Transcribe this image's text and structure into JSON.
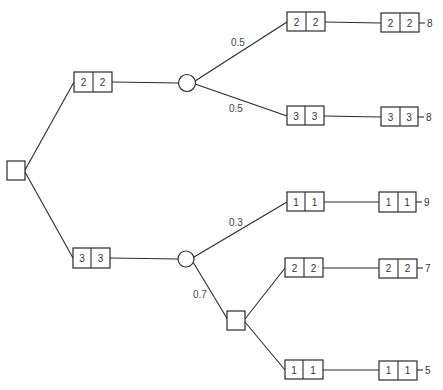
{
  "diagram": {
    "type": "decision-tree",
    "root": {
      "kind": "decision-node",
      "shape": "square"
    },
    "branches": [
      {
        "state": [
          "2",
          "2"
        ],
        "chance_node": "circle",
        "outcomes": [
          {
            "probability": "0.5",
            "state": [
              "2",
              "2"
            ],
            "final_state": [
              "2",
              "2"
            ],
            "payoff": "8"
          },
          {
            "probability": "0.5",
            "state": [
              "3",
              "3"
            ],
            "final_state": [
              "3",
              "3"
            ],
            "payoff": "8"
          }
        ]
      },
      {
        "state": [
          "3",
          "3"
        ],
        "chance_node": "circle",
        "outcomes": [
          {
            "probability": "0.3",
            "state": [
              "1",
              "1"
            ],
            "final_state": [
              "1",
              "1"
            ],
            "payoff": "9"
          },
          {
            "probability": "0.7",
            "decision_node": "square",
            "options": [
              {
                "state": [
                  "2",
                  "2"
                ],
                "final_state": [
                  "2",
                  "2"
                ],
                "payoff": "7"
              },
              {
                "state": [
                  "1",
                  "1"
                ],
                "final_state": [
                  "1",
                  "1"
                ],
                "payoff": "5"
              }
            ]
          }
        ]
      }
    ]
  },
  "labels": {
    "p_top_a": "0.5",
    "p_top_b": "0.5",
    "p_bot_a": "0.3",
    "p_bot_b": "0.7",
    "b1": [
      "2",
      "2"
    ],
    "b2": [
      "3",
      "3"
    ],
    "t1": [
      "2",
      "2"
    ],
    "t1f": [
      "2",
      "2"
    ],
    "t1p": "8",
    "t2": [
      "3",
      "3"
    ],
    "t2f": [
      "3",
      "3"
    ],
    "t2p": "8",
    "t3": [
      "1",
      "1"
    ],
    "t3f": [
      "1",
      "1"
    ],
    "t3p": "9",
    "t4": [
      "2",
      "2"
    ],
    "t4f": [
      "2",
      "2"
    ],
    "t4p": "7",
    "t5": [
      "1",
      "1"
    ],
    "t5f": [
      "1",
      "1"
    ],
    "t5p": "5"
  },
  "colors": {
    "line": "#2a2a2a",
    "text": "#333333",
    "background": "#ffffff"
  }
}
